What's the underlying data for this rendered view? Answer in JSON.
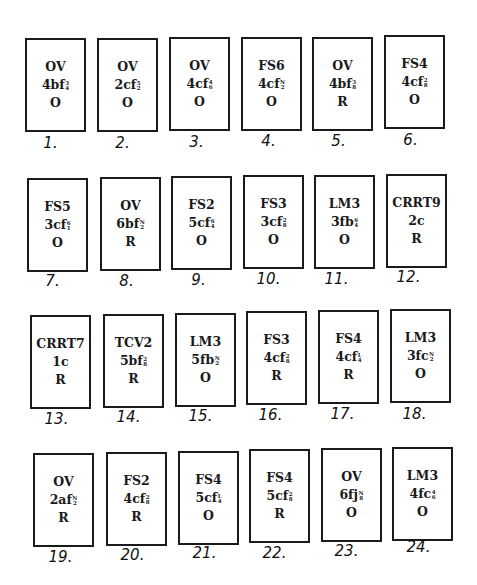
{
  "cards": [
    {
      "n": "1.",
      "label": "OV",
      "code": "4bf",
      "frac": [
        "3",
        "4"
      ],
      "status": "O",
      "x": 25,
      "y": 38,
      "nx": 20,
      "ny": 134
    },
    {
      "n": "2.",
      "label": "OV",
      "code": "2cf",
      "frac": [
        "5",
        "2"
      ],
      "status": "O",
      "x": 97,
      "y": 38,
      "nx": 92,
      "ny": 134
    },
    {
      "n": "3.",
      "label": "OV",
      "code": "4cf",
      "frac": [
        "4",
        "6"
      ],
      "status": "O",
      "x": 169,
      "y": 37,
      "nx": 166,
      "ny": 133
    },
    {
      "n": "4.",
      "label": "FS6",
      "code": "4cf",
      "frac": [
        "N",
        "2"
      ],
      "status": "O",
      "x": 241,
      "y": 37,
      "nx": 238,
      "ny": 132
    },
    {
      "n": "5.",
      "label": "OV",
      "code": "4bf",
      "frac": [
        "3",
        "8"
      ],
      "status": "R",
      "x": 312,
      "y": 37,
      "nx": 308,
      "ny": 132
    },
    {
      "n": "6.",
      "label": "FS4",
      "code": "4cf",
      "frac": [
        "2",
        "8"
      ],
      "status": "O",
      "x": 384,
      "y": 35,
      "nx": 380,
      "ny": 131
    },
    {
      "n": "7.",
      "label": "FS5",
      "code": "3cf",
      "frac": [
        "6",
        "1"
      ],
      "status": "O",
      "x": 27,
      "y": 178,
      "nx": 22,
      "ny": 272
    },
    {
      "n": "8.",
      "label": "OV",
      "code": "6bf",
      "frac": [
        "N",
        "2"
      ],
      "status": "R",
      "x": 100,
      "y": 177,
      "nx": 96,
      "ny": 272
    },
    {
      "n": "9.",
      "label": "FS2",
      "code": "5cf",
      "frac": [
        "6",
        "4"
      ],
      "status": "O",
      "x": 171,
      "y": 176,
      "nx": 168,
      "ny": 271
    },
    {
      "n": "10.",
      "label": "FS3",
      "code": "3cf",
      "frac": [
        "2",
        "8"
      ],
      "status": "O",
      "x": 243,
      "y": 175,
      "nx": 238,
      "ny": 270
    },
    {
      "n": "11.",
      "label": "LM3",
      "code": "3fb",
      "frac": [
        "6",
        "4"
      ],
      "status": "O",
      "x": 314,
      "y": 175,
      "nx": 306,
      "ny": 270
    },
    {
      "n": "12.",
      "label": "CRRT9",
      "code": "2c",
      "frac": null,
      "status": "R",
      "x": 386,
      "y": 174,
      "nx": 378,
      "ny": 268
    },
    {
      "n": "13.",
      "label": "CRRT7",
      "code": "1c",
      "frac": null,
      "status": "R",
      "x": 30,
      "y": 315,
      "nx": 26,
      "ny": 410
    },
    {
      "n": "14.",
      "label": "TCV2",
      "code": "5bf",
      "frac": [
        "2",
        "8"
      ],
      "status": "R",
      "x": 103,
      "y": 314,
      "nx": 98,
      "ny": 408
    },
    {
      "n": "15.",
      "label": "LM3",
      "code": "5fb",
      "frac": [
        "N",
        "2"
      ],
      "status": "O",
      "x": 175,
      "y": 313,
      "nx": 170,
      "ny": 407
    },
    {
      "n": "16.",
      "label": "FS3",
      "code": "4cf",
      "frac": [
        "2",
        "8"
      ],
      "status": "R",
      "x": 246,
      "y": 311,
      "nx": 240,
      "ny": 406
    },
    {
      "n": "17.",
      "label": "FS4",
      "code": "4cf",
      "frac": [
        "L",
        "4"
      ],
      "status": "R",
      "x": 318,
      "y": 310,
      "nx": 312,
      "ny": 405
    },
    {
      "n": "18.",
      "label": "LM3",
      "code": "3fc",
      "frac": [
        "N",
        "2"
      ],
      "status": "O",
      "x": 390,
      "y": 309,
      "nx": 384,
      "ny": 405
    },
    {
      "n": "19.",
      "label": "OV",
      "code": "2af",
      "frac": [
        "N",
        "2"
      ],
      "status": "R",
      "x": 33,
      "y": 453,
      "nx": 30,
      "ny": 548
    },
    {
      "n": "20.",
      "label": "FS2",
      "code": "4cf",
      "frac": [
        "2",
        "8"
      ],
      "status": "R",
      "x": 106,
      "y": 452,
      "nx": 102,
      "ny": 546
    },
    {
      "n": "21.",
      "label": "FS4",
      "code": "5cf",
      "frac": [
        "L",
        "4"
      ],
      "status": "O",
      "x": 178,
      "y": 451,
      "nx": 174,
      "ny": 544
    },
    {
      "n": "22.",
      "label": "FS4",
      "code": "5cf",
      "frac": [
        "2",
        "8"
      ],
      "status": "R",
      "x": 249,
      "y": 449,
      "nx": 244,
      "ny": 544
    },
    {
      "n": "23.",
      "label": "OV",
      "code": "6fj",
      "frac": [
        "N",
        "8"
      ],
      "status": "O",
      "x": 321,
      "y": 448,
      "nx": 316,
      "ny": 542
    },
    {
      "n": "24.",
      "label": "LM3",
      "code": "4fc",
      "frac": [
        "4",
        "6"
      ],
      "status": "O",
      "x": 392,
      "y": 447,
      "nx": 388,
      "ny": 538
    }
  ]
}
